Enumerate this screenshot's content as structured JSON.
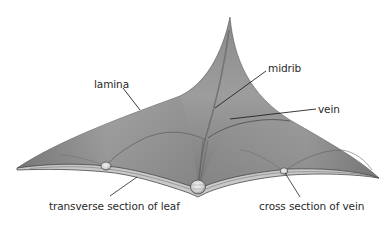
{
  "diagram": {
    "colors": {
      "background": "#ffffff",
      "lamina_light": "#b8b8b8",
      "lamina_dark": "#6e6e6e",
      "edge": "#4a4a4a",
      "leader_line": "#222222",
      "label_text": "#2a2a2a"
    },
    "labels": [
      {
        "id": "lamina",
        "text": "lamina",
        "x": 94,
        "y": 79
      },
      {
        "id": "midrib",
        "text": "midrib",
        "x": 268,
        "y": 63
      },
      {
        "id": "vein",
        "text": "vein",
        "x": 318,
        "y": 104
      },
      {
        "id": "transverse",
        "text": "transverse section of leaf",
        "x": 49,
        "y": 201
      },
      {
        "id": "cross",
        "text": "cross section of vein",
        "x": 259,
        "y": 201
      }
    ]
  }
}
